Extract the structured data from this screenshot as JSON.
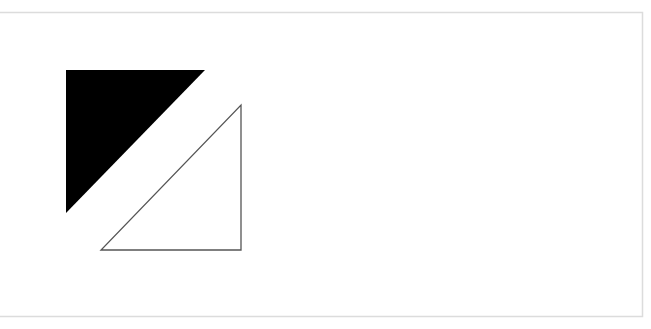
{
  "diagram": {
    "frame": {
      "stroke": "#d8d8d8"
    },
    "shapes": [
      {
        "id": "filled-triangle",
        "type": "right-triangle",
        "fill": "#000000",
        "points": "66,70 205,70 66,213"
      },
      {
        "id": "outlined-triangle",
        "type": "right-triangle",
        "fill": "#ffffff",
        "stroke": "#555555",
        "points": "241,105 241,250 101,250"
      }
    ]
  }
}
